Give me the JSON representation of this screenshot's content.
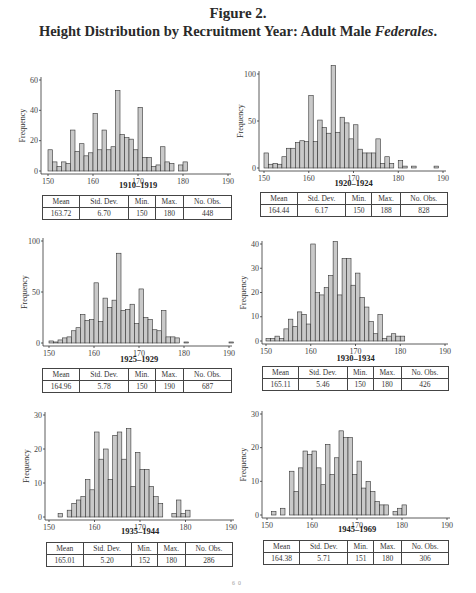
{
  "figure": {
    "number": "Figure 2.",
    "title_main": "Height Distribution by Recruitment Year: Adult Male ",
    "title_italic": "Federales",
    "title_end": "."
  },
  "stat_headers": [
    "Mean",
    "Std. Dev.",
    "Min.",
    "Max.",
    "No. Obs."
  ],
  "chart_data": [
    {
      "type": "bar",
      "title": "1910–1919",
      "xlabel": "",
      "ylabel": "Frequency",
      "xlim": [
        150,
        190
      ],
      "ylim": [
        0,
        60
      ],
      "xticks": [
        150,
        160,
        170,
        180,
        190
      ],
      "yticks": [
        0,
        20,
        40,
        60
      ],
      "x": [
        150,
        151,
        152,
        153,
        154,
        155,
        156,
        157,
        158,
        159,
        160,
        161,
        162,
        163,
        164,
        165,
        166,
        167,
        168,
        169,
        170,
        171,
        172,
        173,
        174,
        175,
        176,
        177,
        179,
        180
      ],
      "values": [
        14,
        6,
        3,
        6,
        5,
        27,
        13,
        18,
        10,
        12,
        38,
        14,
        27,
        14,
        16,
        53,
        24,
        22,
        21,
        14,
        42,
        9,
        9,
        3,
        4,
        16,
        6,
        5,
        4,
        6
      ],
      "stats": {
        "mean": "163.72",
        "sd": "6.70",
        "min": "150",
        "max": "180",
        "n": "448"
      }
    },
    {
      "type": "bar",
      "title": "1920–1924",
      "xlabel": "",
      "ylabel": "Frequency",
      "xlim": [
        150,
        190
      ],
      "ylim": [
        0,
        100
      ],
      "xticks": [
        150,
        160,
        170,
        180,
        190
      ],
      "yticks": [
        0,
        50,
        100
      ],
      "x": [
        150,
        151,
        152,
        153,
        154,
        155,
        156,
        157,
        158,
        159,
        160,
        161,
        162,
        163,
        164,
        165,
        166,
        167,
        168,
        169,
        170,
        171,
        172,
        173,
        174,
        175,
        176,
        177,
        178,
        180,
        181,
        183,
        188
      ],
      "values": [
        16,
        4,
        5,
        4,
        12,
        21,
        21,
        27,
        29,
        28,
        77,
        28,
        51,
        43,
        37,
        109,
        38,
        54,
        48,
        31,
        46,
        20,
        16,
        16,
        16,
        31,
        5,
        12,
        5,
        8,
        2,
        2,
        2
      ],
      "stats": {
        "mean": "164.44",
        "sd": "6.17",
        "min": "150",
        "max": "188",
        "n": "828"
      }
    },
    {
      "type": "bar",
      "title": "1925–1929",
      "xlabel": "",
      "ylabel": "Frequency",
      "xlim": [
        150,
        190
      ],
      "ylim": [
        0,
        100
      ],
      "xticks": [
        150,
        160,
        170,
        180,
        190
      ],
      "yticks": [
        0,
        50,
        100
      ],
      "x": [
        150,
        151,
        152,
        153,
        154,
        155,
        156,
        157,
        158,
        159,
        160,
        161,
        162,
        163,
        164,
        165,
        166,
        167,
        168,
        169,
        170,
        171,
        172,
        173,
        174,
        175,
        176,
        177,
        178,
        180,
        190
      ],
      "values": [
        2,
        1,
        3,
        5,
        6,
        12,
        15,
        28,
        22,
        23,
        59,
        21,
        44,
        35,
        42,
        88,
        32,
        33,
        38,
        19,
        53,
        25,
        23,
        13,
        12,
        32,
        6,
        6,
        5,
        1,
        1
      ],
      "stats": {
        "mean": "164.96",
        "sd": "5.78",
        "min": "150",
        "max": "190",
        "n": "687"
      }
    },
    {
      "type": "bar",
      "title": "1930–1934",
      "xlabel": "",
      "ylabel": "Frequency",
      "xlim": [
        150,
        190
      ],
      "ylim": [
        0,
        40
      ],
      "xticks": [
        150,
        160,
        170,
        180,
        190
      ],
      "yticks": [
        0,
        10,
        20,
        30,
        40
      ],
      "x": [
        150,
        151,
        152,
        153,
        154,
        155,
        156,
        157,
        158,
        159,
        160,
        161,
        162,
        163,
        164,
        165,
        166,
        167,
        168,
        169,
        170,
        171,
        172,
        173,
        174,
        175,
        176,
        177,
        178,
        179,
        180
      ],
      "values": [
        1,
        1,
        2,
        1,
        5,
        9,
        6,
        12,
        11,
        7,
        40,
        20,
        19,
        22,
        27,
        41,
        19,
        34,
        34,
        23,
        28,
        18,
        14,
        8,
        3,
        11,
        1,
        2,
        3,
        2,
        2
      ],
      "stats": {
        "mean": "165.11",
        "sd": "5.46",
        "min": "150",
        "max": "180",
        "n": "426"
      }
    },
    {
      "type": "bar",
      "title": "1935–1944",
      "xlabel": "",
      "ylabel": "Frequency",
      "xlim": [
        150,
        190
      ],
      "ylim": [
        0,
        30
      ],
      "xticks": [
        150,
        160,
        170,
        180,
        190
      ],
      "yticks": [
        0,
        10,
        20,
        30
      ],
      "x": [
        152,
        154,
        155,
        156,
        157,
        158,
        159,
        160,
        161,
        162,
        163,
        164,
        165,
        166,
        167,
        168,
        169,
        170,
        171,
        172,
        173,
        174,
        177,
        178,
        179,
        180
      ],
      "values": [
        1,
        2,
        4,
        5,
        6,
        11,
        8,
        25,
        17,
        20,
        11,
        24,
        25,
        17,
        26,
        9,
        19,
        14,
        14,
        9,
        6,
        4,
        1,
        5,
        1,
        2
      ],
      "stats": {
        "mean": "165.01",
        "sd": "5.20",
        "min": "152",
        "max": "180",
        "n": "286"
      }
    },
    {
      "type": "bar",
      "title": "1945–1969",
      "xlabel": "",
      "ylabel": "Frequency",
      "xlim": [
        150,
        190
      ],
      "ylim": [
        0,
        30
      ],
      "xticks": [
        150,
        160,
        170,
        180,
        190
      ],
      "yticks": [
        0,
        10,
        20,
        30
      ],
      "x": [
        151,
        153,
        155,
        156,
        157,
        158,
        159,
        160,
        161,
        162,
        163,
        164,
        165,
        166,
        167,
        168,
        169,
        170,
        171,
        172,
        173,
        174,
        175,
        176,
        178,
        179,
        180
      ],
      "values": [
        1,
        2,
        13,
        7,
        14,
        19,
        18,
        19,
        14,
        9,
        21,
        12,
        17,
        25,
        23,
        23,
        12,
        16,
        8,
        10,
        7,
        4,
        3,
        3,
        1,
        2,
        3
      ],
      "stats": {
        "mean": "164.38",
        "sd": "5.71",
        "min": "151",
        "max": "180",
        "n": "306"
      }
    }
  ],
  "layout": [
    {
      "left": 0,
      "top": 60,
      "ax_x": 41,
      "x150": 48,
      "x190": 228,
      "y0": 111,
      "ytop": 20,
      "title_y": 128,
      "tbl_left": 42,
      "tbl_top": 195,
      "tbl_w": 190
    },
    {
      "left": 0,
      "top": 60,
      "ax_x": 259,
      "x150": 264,
      "x190": 443,
      "y0": 108,
      "ytop": 14,
      "title_y": 126,
      "tbl_left": 260,
      "tbl_top": 192,
      "tbl_w": 188
    },
    {
      "left": 0,
      "top": 225,
      "ax_x": 43,
      "x150": 49,
      "x190": 229,
      "y0": 118,
      "ytop": 16,
      "title_y": 137,
      "tbl_left": 42,
      "tbl_top": 368,
      "tbl_w": 190
    },
    {
      "left": 0,
      "top": 225,
      "ax_x": 262,
      "x150": 266,
      "x190": 445,
      "y0": 116,
      "ytop": 19,
      "title_y": 136,
      "tbl_left": 262,
      "tbl_top": 366,
      "tbl_w": 187
    },
    {
      "left": 0,
      "top": 395,
      "ax_x": 45,
      "x150": 49,
      "x190": 231,
      "y0": 122,
      "ytop": 20,
      "title_y": 139,
      "tbl_left": 46,
      "tbl_top": 542,
      "tbl_w": 187
    },
    {
      "left": 0,
      "top": 395,
      "ax_x": 262,
      "x150": 267,
      "x190": 447,
      "y0": 120,
      "ytop": 19,
      "title_y": 137,
      "tbl_left": 263,
      "tbl_top": 540,
      "tbl_w": 186
    }
  ],
  "footer_fragment": "60"
}
